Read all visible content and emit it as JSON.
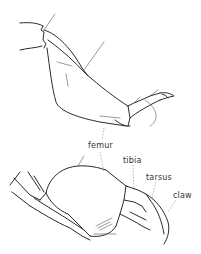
{
  "figure": {
    "labels": {
      "femur": "femur",
      "tibia": "tibia",
      "tarsus": "tarsus",
      "claw": "claw"
    },
    "ink_color": "#2a2a2a",
    "background": "#ffffff"
  }
}
